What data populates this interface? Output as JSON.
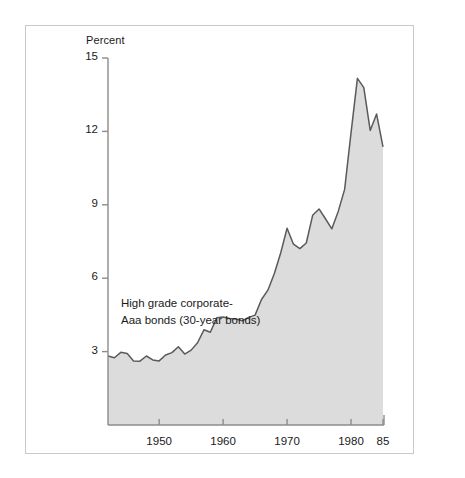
{
  "figure": {
    "background_color": "#ffffff",
    "frame_color": "#c9c9c9"
  },
  "chart_data": {
    "type": "area",
    "title": "",
    "subtitle": "",
    "xlabel": "",
    "ylabel": "Percent",
    "unit_label": "Percent",
    "xlim": [
      1942,
      1985
    ],
    "ylim": [
      0,
      15
    ],
    "grid": false,
    "legend_position": "inside-left",
    "fill_color": "#dcdcdc",
    "line_color": "#5a5a5a",
    "axis_color": "#8c8c8c",
    "ytick_labels": [
      "15",
      "12",
      "9",
      "6",
      "3"
    ],
    "ytick_values": [
      15,
      12,
      9,
      6,
      3
    ],
    "xtick_labels": [
      "1950",
      "1960",
      "1970",
      "1980",
      "85"
    ],
    "xtick_values": [
      1950,
      1960,
      1970,
      1980,
      1985
    ],
    "annotations": [
      {
        "name": "series-label",
        "line1": "High grade corporate-",
        "line2": "Aaa bonds (30-year bonds)"
      }
    ],
    "series": [
      {
        "name": "High grade corporate-Aaa bonds (30-year bonds)",
        "x": [
          1942,
          1943,
          1944,
          1945,
          1946,
          1947,
          1948,
          1949,
          1950,
          1951,
          1952,
          1953,
          1954,
          1955,
          1956,
          1957,
          1958,
          1959,
          1960,
          1961,
          1962,
          1963,
          1964,
          1965,
          1966,
          1967,
          1968,
          1969,
          1970,
          1971,
          1972,
          1973,
          1974,
          1975,
          1976,
          1977,
          1978,
          1979,
          1980,
          1981,
          1982,
          1983,
          1984,
          1985
        ],
        "values": [
          2.82,
          2.75,
          2.97,
          2.92,
          2.62,
          2.61,
          2.82,
          2.66,
          2.62,
          2.86,
          2.96,
          3.2,
          2.9,
          3.06,
          3.36,
          3.89,
          3.79,
          4.38,
          4.41,
          4.35,
          4.33,
          4.26,
          4.4,
          4.49,
          5.13,
          5.51,
          6.18,
          7.03,
          8.04,
          7.39,
          7.21,
          7.44,
          8.57,
          8.83,
          8.43,
          8.02,
          8.73,
          9.63,
          11.94,
          14.17,
          13.79,
          12.04,
          12.71,
          11.37
        ]
      }
    ]
  },
  "layout": {
    "plot_left_px": 108,
    "plot_right_px": 383,
    "plot_top_px": 58,
    "plot_bottom_px": 425,
    "x_min_year": 1942,
    "x_max_year": 1985,
    "y_min": 0,
    "y_max": 15
  }
}
